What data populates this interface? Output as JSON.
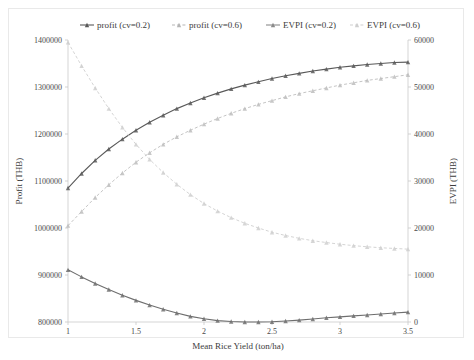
{
  "chart_data": {
    "type": "line",
    "title": "",
    "xlabel": "Mean Rice Yield (ton/ha)",
    "ylabel": "Profit (THB)",
    "y2label": "EVPI (THB)",
    "xlim": [
      1,
      3.5
    ],
    "ylim": [
      800000,
      1400000
    ],
    "y2lim": [
      0,
      60000
    ],
    "xticks": [
      "1",
      "1.5",
      "2",
      "2.5",
      "3",
      "3.5"
    ],
    "xtick_values": [
      1,
      1.5,
      2,
      2.5,
      3,
      3.5
    ],
    "yticks": [
      "800000",
      "900000",
      "1000000",
      "1100000",
      "1200000",
      "1300000",
      "1400000"
    ],
    "ytick_values": [
      800000,
      900000,
      1000000,
      1100000,
      1200000,
      1300000,
      1400000
    ],
    "y2ticks": [
      "0",
      "10000",
      "20000",
      "30000",
      "40000",
      "50000",
      "60000"
    ],
    "y2tick_values": [
      0,
      10000,
      20000,
      30000,
      40000,
      50000,
      60000
    ],
    "grid": false,
    "legend_position": "top",
    "x": [
      1,
      1.1,
      1.2,
      1.3,
      1.4,
      1.5,
      1.6,
      1.7,
      1.8,
      1.9,
      2,
      2.1,
      2.2,
      2.3,
      2.4,
      2.5,
      2.6,
      2.7,
      2.8,
      2.9,
      3,
      3.1,
      3.2,
      3.3,
      3.4,
      3.5
    ],
    "series": [
      {
        "name": "profit (cv=0.2)",
        "axis": "left",
        "color": "#595959",
        "line_style": "solid",
        "marker": "triangle",
        "values": [
          1085000,
          1116000,
          1144000,
          1168000,
          1189000,
          1208000,
          1225000,
          1240000,
          1254000,
          1266000,
          1277000,
          1287000,
          1296000,
          1304000,
          1311000,
          1318000,
          1324000,
          1329000,
          1334000,
          1338000,
          1342000,
          1345000,
          1348000,
          1350000,
          1352000,
          1353000
        ]
      },
      {
        "name": "profit (cv=0.6)",
        "axis": "left",
        "color": "#6e6e6e",
        "line_style": "solid",
        "marker": "triangle",
        "values": [
          911000,
          896000,
          882000,
          869000,
          857000,
          846000,
          836000,
          827000,
          819000,
          812000,
          807000,
          803000,
          801000,
          800000,
          800000,
          800500,
          802000,
          804000,
          806500,
          809000,
          811000,
          813000,
          815000,
          817000,
          819000,
          821000
        ]
      },
      {
        "name": "EVPI (cv=0.2)",
        "axis": "right",
        "color": "#bdbdbd",
        "line_style": "dashed",
        "marker": "triangle",
        "values": [
          20500,
          23500,
          26500,
          29200,
          31700,
          34000,
          36000,
          37800,
          39400,
          40800,
          42100,
          43300,
          44400,
          45400,
          46300,
          47100,
          47900,
          48600,
          49200,
          49800,
          50400,
          50900,
          51400,
          51800,
          52200,
          52600
        ]
      },
      {
        "name": "EVPI (cv=0.6)",
        "axis": "right",
        "color": "#cfcfcf",
        "line_style": "dashed",
        "marker": "triangle",
        "values": [
          59500,
          54500,
          49800,
          45400,
          41400,
          37800,
          34600,
          31800,
          29300,
          27100,
          25200,
          23600,
          22200,
          21000,
          20000,
          19100,
          18400,
          17800,
          17300,
          16900,
          16550,
          16250,
          16000,
          15800,
          15650,
          15500
        ]
      }
    ]
  },
  "legend": {
    "items": [
      {
        "label": "profit (cv=0.2)",
        "color": "#595959",
        "style": "solid"
      },
      {
        "label": "profit (cv=0.6)",
        "color": "#b5b5b5",
        "style": "dashed"
      },
      {
        "label": "EVPI (cv=0.2)",
        "color": "#8a8a8a",
        "style": "solid"
      },
      {
        "label": "EVPI (cv=0.6)",
        "color": "#cfcfcf",
        "style": "dashed"
      }
    ]
  }
}
